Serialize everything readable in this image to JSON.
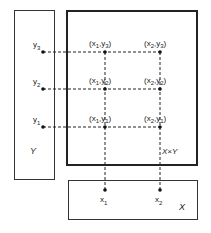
{
  "diagram": {
    "sets": {
      "Y": {
        "label": "Y"
      },
      "XxY": {
        "label": "X×Y"
      },
      "X": {
        "label": "X"
      }
    },
    "y_points": [
      {
        "name": "y",
        "sub": "3"
      },
      {
        "name": "y",
        "sub": "2"
      },
      {
        "name": "y",
        "sub": "1"
      }
    ],
    "x_points": [
      {
        "name": "x",
        "sub": "1"
      },
      {
        "name": "x",
        "sub": "2"
      }
    ],
    "pairs": [
      {
        "x_sub": "1",
        "y_sub": "3"
      },
      {
        "x_sub": "2",
        "y_sub": "3"
      },
      {
        "x_sub": "1",
        "y_sub": "2"
      },
      {
        "x_sub": "2",
        "y_sub": "2"
      },
      {
        "x_sub": "1",
        "y_sub": "1"
      },
      {
        "x_sub": "2",
        "y_sub": "1"
      }
    ],
    "colors": {
      "line": "#222222",
      "background": "#ffffff"
    }
  }
}
